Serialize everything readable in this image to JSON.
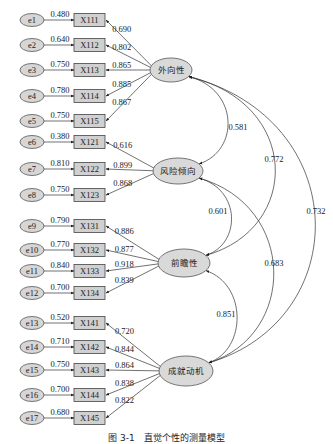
{
  "caption": "图 3-1　直觉个性的测量模型",
  "chart_data": {
    "type": "sem_path_diagram",
    "latent_factors": [
      {
        "id": "F1",
        "label": "外向性",
        "cx": 171,
        "cy": 70,
        "rx": 21,
        "ry": 12
      },
      {
        "id": "F2",
        "label": "风险倾向",
        "cx": 178,
        "cy": 171,
        "rx": 25,
        "ry": 13
      },
      {
        "id": "F3",
        "label": "前瞻性",
        "cx": 184,
        "cy": 263,
        "rx": 26,
        "ry": 14
      },
      {
        "id": "F4",
        "label": "成就动机",
        "cx": 186,
        "cy": 371,
        "rx": 27,
        "ry": 15
      }
    ],
    "indicators": [
      {
        "err": "e1",
        "item": "X111",
        "factor": "F1",
        "err_loading": "0.480",
        "loading": "0.690",
        "y": 20
      },
      {
        "err": "e2",
        "item": "X112",
        "factor": "F1",
        "err_loading": "0.640",
        "loading": "0.802",
        "y": 45
      },
      {
        "err": "e3",
        "item": "X113",
        "factor": "F1",
        "err_loading": "0.750",
        "loading": "0.865",
        "y": 70
      },
      {
        "err": "e4",
        "item": "X114",
        "factor": "F1",
        "err_loading": "0.780",
        "loading": "0.885",
        "y": 96
      },
      {
        "err": "e5",
        "item": "X115",
        "factor": "F1",
        "err_loading": "0.750",
        "loading": "0.867",
        "y": 121
      },
      {
        "err": "e6",
        "item": "X121",
        "factor": "F2",
        "err_loading": "0.380",
        "loading": "0.616",
        "y": 142
      },
      {
        "err": "e7",
        "item": "X122",
        "factor": "F2",
        "err_loading": "0.810",
        "loading": "0.899",
        "y": 169
      },
      {
        "err": "e8",
        "item": "X123",
        "factor": "F2",
        "err_loading": "0.750",
        "loading": "0.868",
        "y": 195
      },
      {
        "err": "e9",
        "item": "X131",
        "factor": "F3",
        "err_loading": "0.790",
        "loading": "0.886",
        "y": 226
      },
      {
        "err": "e10",
        "item": "X132",
        "factor": "F3",
        "err_loading": "0.770",
        "loading": "0.877",
        "y": 250
      },
      {
        "err": "e11",
        "item": "X133",
        "factor": "F3",
        "err_loading": "0.840",
        "loading": "0.918",
        "y": 271
      },
      {
        "err": "e12",
        "item": "X134",
        "factor": "F3",
        "err_loading": "0.700",
        "loading": "0.839",
        "y": 293
      },
      {
        "err": "e13",
        "item": "X141",
        "factor": "F4",
        "err_loading": "0.520",
        "loading": "0.720",
        "y": 323
      },
      {
        "err": "e14",
        "item": "X142",
        "factor": "F4",
        "err_loading": "0.710",
        "loading": "0.844",
        "y": 347
      },
      {
        "err": "e15",
        "item": "X143",
        "factor": "F4",
        "err_loading": "0.750",
        "loading": "0.864",
        "y": 370
      },
      {
        "err": "e16",
        "item": "X144",
        "factor": "F4",
        "err_loading": "0.700",
        "loading": "0.838",
        "y": 395
      },
      {
        "err": "e17",
        "item": "X145",
        "factor": "F4",
        "err_loading": "0.680",
        "loading": "0.822",
        "y": 418
      }
    ],
    "correlations": [
      {
        "from": "F1",
        "to": "F2",
        "value": "0.581"
      },
      {
        "from": "F1",
        "to": "F3",
        "value": "0.772"
      },
      {
        "from": "F1",
        "to": "F4",
        "value": "0.732"
      },
      {
        "from": "F2",
        "to": "F3",
        "value": "0.601"
      },
      {
        "from": "F2",
        "to": "F4",
        "value": "0.683"
      },
      {
        "from": "F3",
        "to": "F4",
        "value": "0.851"
      }
    ]
  }
}
